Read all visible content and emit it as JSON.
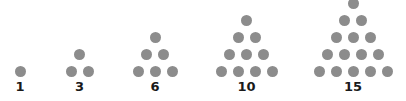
{
  "dot_color": "#8c8c8c",
  "figures": [
    {
      "label": "1",
      "rows": 1,
      "center_x": 20
    },
    {
      "label": "3",
      "rows": 2,
      "center_x": 79.5
    },
    {
      "label": "6",
      "rows": 3,
      "center_x": 155
    },
    {
      "label": "10",
      "rows": 4,
      "center_x": 246.5
    },
    {
      "label": "15",
      "rows": 5,
      "center_x": 353
    }
  ]
}
